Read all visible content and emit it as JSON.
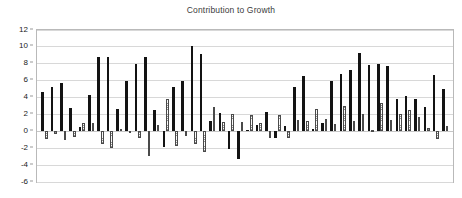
{
  "chart": {
    "title": "Contribution to Growth",
    "xlabel": "",
    "ylabel": ""
  },
  "axis": {
    "y_ticks": [
      "12",
      "10",
      "8",
      "6",
      "4",
      "2",
      "0",
      "-2",
      "-4",
      "-6"
    ]
  },
  "colors": {
    "dark_bar": "#131313",
    "light_bar_fill": "#fbfbfb",
    "light_bar_edge": "#4a4a4a",
    "gridline": "#d8d8d8",
    "frame": "#b9b9b9",
    "title_text": "#3b3b3b",
    "tick_text": "#222222",
    "background": "#ffffff"
  },
  "chart_data": {
    "type": "bar",
    "title": "Contribution to Growth",
    "xlabel": "",
    "ylabel": "",
    "ylim": [
      -6,
      12
    ],
    "ytick_values": [
      12,
      10,
      8,
      6,
      4,
      2,
      0,
      -2,
      -4,
      -6
    ],
    "grid": true,
    "legend": "none",
    "categories": [
      "1",
      "2",
      "3",
      "4",
      "5",
      "6",
      "7",
      "8",
      "9",
      "10",
      "11",
      "12",
      "13",
      "14",
      "15",
      "16",
      "17",
      "18",
      "19",
      "20",
      "21",
      "22",
      "23",
      "24",
      "25",
      "26",
      "27",
      "28",
      "29",
      "30",
      "31",
      "32",
      "33",
      "34",
      "35",
      "36",
      "37",
      "38"
    ],
    "series": [
      {
        "name": "Series 1",
        "style": "solid-black",
        "values": [
          4.6,
          5.2,
          5.65,
          2.7,
          0.4,
          4.25,
          8.7,
          8.75,
          2.6,
          5.9,
          7.9,
          8.8,
          2.45,
          -1.95,
          5.25,
          5.85,
          10.0,
          9.05,
          1.15,
          2.1,
          -2.2,
          -3.35,
          0.15,
          0.75,
          2.2,
          -0.85,
          0.55,
          5.15,
          6.45,
          0.2,
          0.9,
          5.95,
          6.75,
          7.15,
          9.2,
          7.75,
          7.9,
          7.7
        ]
      },
      {
        "name": "Series 2",
        "style": "stippled-outline",
        "values": [
          -0.95,
          -0.4,
          -1.1,
          -0.75,
          0.9,
          0.95,
          -1.6,
          -2.05,
          0.2,
          -0.1,
          -0.9,
          -2.95,
          0.75,
          -2.2,
          -1.75,
          -0.6,
          -1.55,
          -2.5,
          2.8,
          1.05,
          1.85,
          0.75,
          1.9,
          0.9,
          -0.85,
          1.85,
          -0.75,
          -0.9,
          1.25,
          1.15,
          2.55,
          1.4,
          0.8,
          2.9,
          1.15,
          2.05,
          0.1,
          3.35
        ]
      }
    ],
    "tail_series": [
      {
        "name": "Series 1 (continued)",
        "style": "solid-black",
        "values": [
          3.75,
          4.15,
          3.75,
          2.8,
          6.65,
          4.9
        ]
      },
      {
        "name": "Series 2 (continued)",
        "style": "stippled-outline",
        "values": [
          1.25,
          2.05,
          2.45,
          1.6,
          0.3,
          -1.0,
          0.6
        ]
      }
    ],
    "pairs": [
      {
        "dark": 4.6,
        "light": -0.95
      },
      {
        "dark": 5.2,
        "light": -0.4
      },
      {
        "dark": 5.65,
        "light": -1.1
      },
      {
        "dark": 2.7,
        "light": -0.75
      },
      {
        "dark": 0.4,
        "light": 0.9
      },
      {
        "dark": 4.25,
        "light": 0.95
      },
      {
        "dark": 8.7,
        "light": -1.6
      },
      {
        "dark": 8.75,
        "light": -2.05
      },
      {
        "dark": 2.6,
        "light": 0.2
      },
      {
        "dark": 5.9,
        "light": -0.1
      },
      {
        "dark": 7.9,
        "light": -0.9
      },
      {
        "dark": 8.8,
        "light": -2.95
      },
      {
        "dark": 2.45,
        "light": 0.75
      },
      {
        "dark": -1.95,
        "light": 3.8
      },
      {
        "dark": 5.25,
        "light": -1.75
      },
      {
        "dark": 5.85,
        "light": -0.6
      },
      {
        "dark": 10.0,
        "light": -1.55
      },
      {
        "dark": 9.05,
        "light": -2.5
      },
      {
        "dark": 1.15,
        "light": 2.8
      },
      {
        "dark": 2.1,
        "light": 1.05
      },
      {
        "dark": -2.2,
        "light": 2.05
      },
      {
        "dark": -3.35,
        "light": 1.05
      },
      {
        "dark": 0.15,
        "light": 1.85
      },
      {
        "dark": 0.75,
        "light": 0.9
      },
      {
        "dark": 2.2,
        "light": -0.85
      },
      {
        "dark": -0.85,
        "light": 1.85
      },
      {
        "dark": 0.55,
        "light": -0.85
      },
      {
        "dark": 5.15,
        "light": 1.25
      },
      {
        "dark": 6.45,
        "light": 1.15
      },
      {
        "dark": 0.2,
        "light": 2.55
      },
      {
        "dark": 0.9,
        "light": 1.4
      },
      {
        "dark": 5.95,
        "light": 0.8
      },
      {
        "dark": 6.75,
        "light": 2.9
      },
      {
        "dark": 7.15,
        "light": 1.15
      },
      {
        "dark": 9.2,
        "light": 2.05
      },
      {
        "dark": 7.75,
        "light": 0.1
      },
      {
        "dark": 7.9,
        "light": 3.35
      },
      {
        "dark": 7.7,
        "light": 1.25
      },
      {
        "dark": 3.75,
        "light": 2.05
      },
      {
        "dark": 4.15,
        "light": 2.45
      },
      {
        "dark": 3.75,
        "light": 1.6
      },
      {
        "dark": 2.8,
        "light": 0.3
      },
      {
        "dark": 6.65,
        "light": -1.0
      },
      {
        "dark": 4.9,
        "light": 0.6
      }
    ]
  }
}
